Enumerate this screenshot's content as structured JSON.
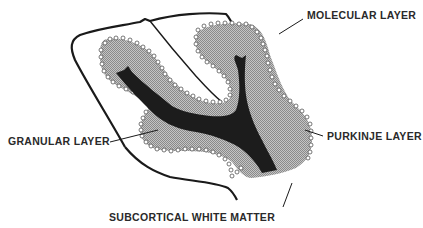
{
  "figure": {
    "labels": {
      "molecular": "MOLECULAR LAYER",
      "granular": "GRANULAR LAYER",
      "purkinje": "PURKINJE LAYER",
      "subcortical": "SUBCORTICAL WHITE MATTER"
    },
    "colors": {
      "outline": "#1a1a1a",
      "white_matter": "#1c1c1c",
      "granular_fill": "#a8a8a8",
      "purkinje_cells": "#ffffff",
      "background": "#ffffff",
      "text": "#2a2a2a"
    }
  }
}
